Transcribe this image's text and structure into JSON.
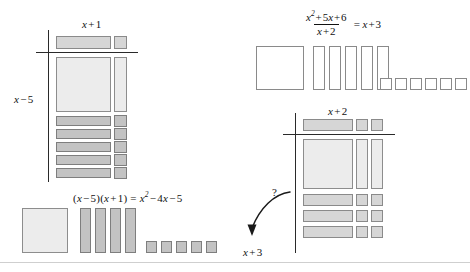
{
  "figure": {
    "kind": "algebra-tiles-worksheet",
    "background_color": "#ffffff",
    "tile_colors": {
      "light": "#ececec",
      "mid": "#d6d6d6",
      "dark": "#c3c3c3",
      "outline": "#8a8a8a",
      "axis": "#2a2a2a",
      "frame_rule": "#cfcfcf"
    }
  },
  "panel_top_left": {
    "name": "factored-product-grid",
    "top_label": "x + 1",
    "top_label_parts": {
      "var": "x",
      "op": "+",
      "const": "1"
    },
    "side_label": "x – 5",
    "side_label_parts": {
      "var": "x",
      "op": "–",
      "const": "5"
    },
    "grid": {
      "top_strip_tiles": [
        {
          "type": "x-bar-horizontal",
          "count": 1,
          "shade": "mid"
        },
        {
          "type": "unit-square",
          "count": 1,
          "shade": "mid"
        }
      ],
      "body_rows": [
        {
          "row": "x-squared-row",
          "tiles": [
            {
              "type": "x-squared-square",
              "count": 1,
              "shade": "light"
            },
            {
              "type": "x-bar-vertical",
              "count": 1,
              "shade": "light"
            }
          ]
        },
        {
          "row": "unit-row-1",
          "tiles": [
            {
              "type": "x-bar-horizontal",
              "count": 1,
              "shade": "dark"
            },
            {
              "type": "unit-square",
              "count": 1,
              "shade": "dark"
            }
          ]
        },
        {
          "row": "unit-row-2",
          "tiles": [
            {
              "type": "x-bar-horizontal",
              "count": 1,
              "shade": "dark"
            },
            {
              "type": "unit-square",
              "count": 1,
              "shade": "dark"
            }
          ]
        },
        {
          "row": "unit-row-3",
          "tiles": [
            {
              "type": "x-bar-horizontal",
              "count": 1,
              "shade": "dark"
            },
            {
              "type": "unit-square",
              "count": 1,
              "shade": "dark"
            }
          ]
        },
        {
          "row": "unit-row-4",
          "tiles": [
            {
              "type": "x-bar-horizontal",
              "count": 1,
              "shade": "dark"
            },
            {
              "type": "unit-square",
              "count": 1,
              "shade": "dark"
            }
          ]
        },
        {
          "row": "unit-row-5",
          "tiles": [
            {
              "type": "x-bar-horizontal",
              "count": 1,
              "shade": "dark"
            },
            {
              "type": "unit-square",
              "count": 1,
              "shade": "dark"
            }
          ]
        }
      ]
    }
  },
  "panel_bottom_left": {
    "name": "expanded-product-tiles",
    "equation_plain": "(x – 5)(x + 1) = x² – 4x – 5",
    "equation_parts": {
      "left_factor": "(x – 5)",
      "right_factor": "(x + 1)",
      "equals": "=",
      "result_square": "x²",
      "result_linear": "– 4x",
      "result_constant": "– 5"
    },
    "tile_sets": [
      {
        "label": "x-squared",
        "type": "x-squared-square",
        "count": 1,
        "shade": "light"
      },
      {
        "label": "x-bars",
        "type": "x-bar-vertical",
        "count": 4,
        "shade": "dark"
      },
      {
        "label": "unit-squares",
        "type": "unit-square",
        "count": 5,
        "shade": "dark"
      }
    ]
  },
  "panel_top_right": {
    "name": "division-expression",
    "expression_plain": "(x² + 5x + 6) / (x + 2) = x + 3",
    "numerator": "x² + 5x + 6",
    "numerator_parts": {
      "square": "x²",
      "linear": "+ 5x",
      "constant": "+ 6"
    },
    "denominator": "x + 2",
    "equals": "=",
    "quotient": "x + 3",
    "tile_sets": [
      {
        "label": "x-squared",
        "type": "x-squared-square",
        "count": 1,
        "shade": "open"
      },
      {
        "label": "x-bars",
        "type": "x-bar-vertical",
        "count": 5,
        "shade": "open"
      },
      {
        "label": "unit-squares",
        "type": "unit-square",
        "count": 6,
        "shade": "open"
      }
    ]
  },
  "panel_bottom_right": {
    "name": "division-grid",
    "top_label": "x + 2",
    "top_label_parts": {
      "var": "x",
      "op": "+",
      "const": "2"
    },
    "question_mark": "?",
    "answer_label": "x + 3",
    "answer_label_parts": {
      "var": "x",
      "op": "+",
      "const": "3"
    },
    "arrow": {
      "name": "curved-arrow",
      "direction": "down-left",
      "from": "?",
      "to": "x + 3"
    },
    "grid": {
      "top_strip_tiles": [
        {
          "type": "x-bar-horizontal",
          "count": 1,
          "shade": "mid"
        },
        {
          "type": "unit-square",
          "count": 2,
          "shade": "mid"
        }
      ],
      "body_rows": [
        {
          "row": "x-squared-row",
          "tiles": [
            {
              "type": "x-squared-square",
              "count": 1,
              "shade": "light"
            },
            {
              "type": "x-bar-vertical",
              "count": 2,
              "shade": "light"
            }
          ]
        },
        {
          "row": "unit-row-1",
          "tiles": [
            {
              "type": "x-bar-horizontal",
              "count": 1,
              "shade": "mid"
            },
            {
              "type": "unit-square",
              "count": 2,
              "shade": "mid"
            }
          ]
        },
        {
          "row": "unit-row-2",
          "tiles": [
            {
              "type": "x-bar-horizontal",
              "count": 1,
              "shade": "mid"
            },
            {
              "type": "unit-square",
              "count": 2,
              "shade": "mid"
            }
          ]
        },
        {
          "row": "unit-row-3",
          "tiles": [
            {
              "type": "x-bar-horizontal",
              "count": 1,
              "shade": "mid"
            },
            {
              "type": "unit-square",
              "count": 2,
              "shade": "mid"
            }
          ]
        }
      ]
    }
  }
}
